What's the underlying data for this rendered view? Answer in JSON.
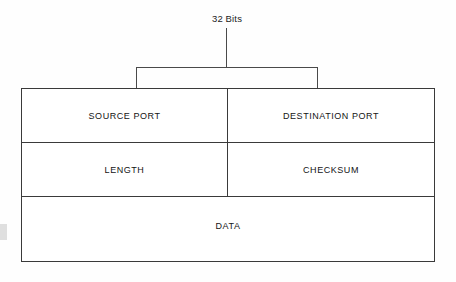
{
  "diagram": {
    "width_annotation": {
      "label": "32 Bits"
    },
    "rows": [
      {
        "name": "ports",
        "cells": [
          {
            "label": "SOURCE PORT",
            "width": "half"
          },
          {
            "label": "DESTINATION PORT",
            "width": "half"
          }
        ]
      },
      {
        "name": "meta",
        "cells": [
          {
            "label": "LENGTH",
            "width": "half"
          },
          {
            "label": "CHECKSUM",
            "width": "half"
          }
        ]
      },
      {
        "name": "payload",
        "cells": [
          {
            "label": "DATA",
            "width": "full"
          }
        ]
      }
    ]
  },
  "colors": {
    "background": "#fefefe",
    "cell_fill": "#ffffff",
    "border": "#3a3a3a",
    "annotation_line": "#4a4a4a",
    "text": "#141414"
  }
}
